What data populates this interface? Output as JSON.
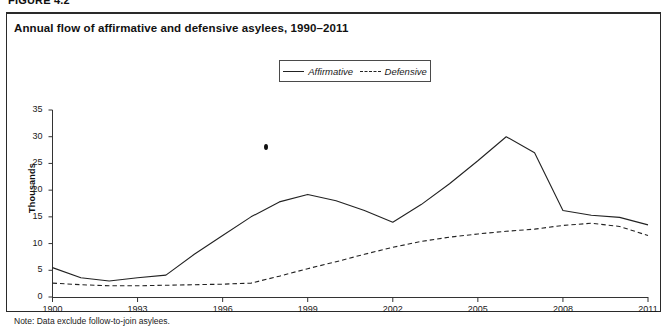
{
  "figure": {
    "number": "FIGURE 4.2",
    "title": "Annual flow of affirmative and defensive asylees, 1990–2011",
    "note": "Note: Data exclude follow-to-join asylees."
  },
  "legend": {
    "position": "top-center",
    "entries": [
      {
        "label": "Affirmative",
        "style": "solid"
      },
      {
        "label": "Defensive",
        "style": "dashed"
      }
    ]
  },
  "axes": {
    "y_title": "Thousands",
    "y_ticks": [
      "0",
      "5",
      "10",
      "15",
      "20",
      "25",
      "30",
      "35"
    ],
    "x_ticks": [
      "1900",
      "1993",
      "1996",
      "1999",
      "2002",
      "2005",
      "2008",
      "2011"
    ]
  },
  "chart_data": {
    "type": "line",
    "title": "Annual flow of affirmative and defensive asylees, 1990–2011",
    "xlabel": "",
    "ylabel": "Thousands",
    "ylim": [
      0,
      35
    ],
    "xlim": [
      1990,
      2011
    ],
    "grid": false,
    "legend_position": "top-center",
    "x": [
      1990,
      1991,
      1992,
      1993,
      1994,
      1995,
      1996,
      1997,
      1998,
      1999,
      2000,
      2001,
      2002,
      2003,
      2004,
      2005,
      2006,
      2007,
      2008,
      2009,
      2010,
      2011
    ],
    "xtick_labels": [
      "1900",
      "1993",
      "1996",
      "1999",
      "2002",
      "2005",
      "2008",
      "2011"
    ],
    "xtick_values": [
      1990,
      1993,
      1996,
      1999,
      2002,
      2005,
      2008,
      2011
    ],
    "ytick_values": [
      0,
      5,
      10,
      15,
      20,
      25,
      30,
      35
    ],
    "series": [
      {
        "name": "Affirmative",
        "style": "solid",
        "color": "#222222",
        "values": [
          5.5,
          3.6,
          3.0,
          3.6,
          4.1,
          8.0,
          11.5,
          15.0,
          17.8,
          19.2,
          18.0,
          16.2,
          14.0,
          17.3,
          21.2,
          25.5,
          30.0,
          27.0,
          16.2,
          15.3,
          14.9,
          13.5
        ]
      },
      {
        "name": "Defensive",
        "style": "dashed",
        "color": "#222222",
        "values": [
          2.6,
          2.3,
          2.1,
          2.1,
          2.2,
          2.3,
          2.4,
          2.6,
          3.9,
          5.3,
          6.6,
          8.0,
          9.3,
          10.4,
          11.2,
          11.8,
          12.3,
          12.7,
          13.4,
          13.8,
          13.2,
          11.5
        ]
      }
    ],
    "series_plot_x": [
      1990,
      1991,
      1992,
      1993,
      1994,
      1995,
      1996,
      1997,
      1998,
      1999,
      2000,
      2001,
      2002,
      2003,
      2004,
      2005,
      2006,
      2007,
      2008,
      2009,
      2010,
      2011
    ],
    "affirmative_plot": [
      5.5,
      3.6,
      3.0,
      3.6,
      4.1,
      8.0,
      11.5,
      15.0,
      17.8,
      19.2,
      18.0,
      16.2,
      14.0,
      17.3,
      21.2,
      25.5,
      30.0,
      27.0,
      16.2,
      15.3,
      14.9,
      13.5
    ],
    "defensive_plot": [
      2.6,
      2.3,
      2.1,
      2.1,
      2.2,
      2.3,
      2.4,
      2.6,
      3.9,
      5.3,
      6.6,
      8.0,
      9.3,
      10.4,
      11.2,
      11.8,
      12.3,
      12.7,
      13.4,
      13.8,
      13.2,
      11.5
    ]
  }
}
